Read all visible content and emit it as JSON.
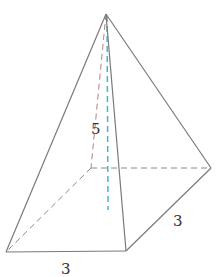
{
  "diagram": {
    "type": "square pyramid",
    "labels": {
      "height": "5",
      "base_front": "3",
      "base_side": "3"
    },
    "colors": {
      "edge": "#7a7a7a",
      "hidden_edge": "#8a8a8a",
      "height_line": "#3fb8d8",
      "slant_line": "#c98a8a"
    }
  }
}
